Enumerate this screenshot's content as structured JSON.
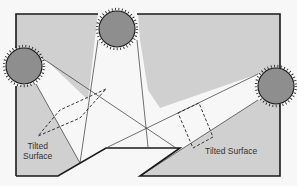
{
  "diagram": {
    "type": "illustration",
    "labels": {
      "left_surface_line1": "Tilted",
      "left_surface_line2": "Surface",
      "right_surface": "Tilted Surface"
    },
    "colors": {
      "background": "#f7f7f7",
      "shaded_region": "#d0d0d0",
      "sun_fill": "#8e8e8e",
      "sun_outline": "#1a1a1a",
      "frame_line": "#1a1a1a",
      "ray_line": "#333333"
    },
    "suns": [
      {
        "name": "left-sun",
        "cx": 24,
        "cy": 66,
        "r": 19
      },
      {
        "name": "top-sun",
        "cx": 117,
        "cy": 29,
        "r": 19
      },
      {
        "name": "right-sun",
        "cx": 276,
        "cy": 86,
        "r": 19
      }
    ]
  }
}
